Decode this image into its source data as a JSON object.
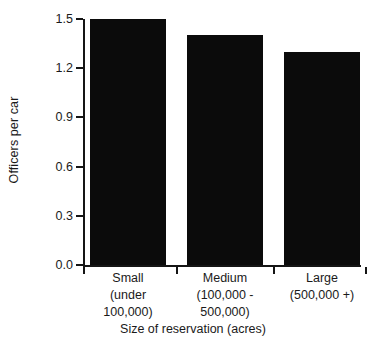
{
  "chart_data": {
    "type": "bar",
    "title": "",
    "categories": [
      "Small",
      "Medium",
      "Large"
    ],
    "category_sublabels": [
      [
        "(under",
        "100,000)"
      ],
      [
        "(100,000 -",
        "500,000)"
      ],
      [
        "(500,000 +)",
        ""
      ]
    ],
    "values": [
      1.5,
      1.4,
      1.3
    ],
    "xlabel": "Size of reservation (acres)",
    "ylabel": "Officers per car",
    "ylim": [
      0.0,
      1.5
    ],
    "yticks": [
      "0.0",
      "0.3",
      "0.6",
      "0.9",
      "1.2",
      "1.5"
    ],
    "ytick_values": [
      0.0,
      0.3,
      0.6,
      0.9,
      1.2,
      1.5
    ],
    "grid": false,
    "legend": null,
    "bar_color": "#0b0b0b",
    "axis_color": "#151515",
    "background_color": "#ffffff"
  },
  "axes": {
    "y_title": "Officers per car",
    "x_title": "Size of reservation (acres)"
  },
  "ticks": {
    "y": [
      {
        "label": "0.0",
        "value": 0.0
      },
      {
        "label": "0.3",
        "value": 0.3
      },
      {
        "label": "0.6",
        "value": 0.6
      },
      {
        "label": "0.9",
        "value": 0.9
      },
      {
        "label": "1.2",
        "value": 1.2
      },
      {
        "label": "1.5",
        "value": 1.5
      }
    ]
  },
  "bars": [
    {
      "name": "small",
      "value": 1.5,
      "label_line1": "Small",
      "label_line2": "(under",
      "label_line3": "100,000)"
    },
    {
      "name": "medium",
      "value": 1.4,
      "label_line1": "Medium",
      "label_line2": "(100,000 -",
      "label_line3": "500,000)"
    },
    {
      "name": "large",
      "value": 1.3,
      "label_line1": "Large",
      "label_line2": "(500,000 +)",
      "label_line3": ""
    }
  ]
}
